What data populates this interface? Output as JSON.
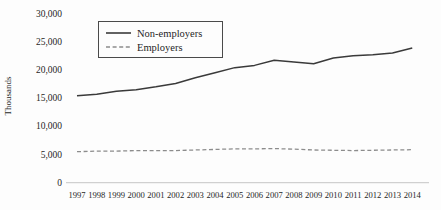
{
  "chart_data": {
    "type": "line",
    "title": "",
    "xlabel": "",
    "ylabel": "Thousands",
    "categories": [
      1997,
      1998,
      1999,
      2000,
      2001,
      2002,
      2003,
      2004,
      2005,
      2006,
      2007,
      2008,
      2009,
      2010,
      2011,
      2012,
      2013,
      2014
    ],
    "series": [
      {
        "name": "Non-employers",
        "line_style": "solid",
        "color": "#3a3a3a",
        "values": [
          15400,
          15700,
          16200,
          16500,
          17000,
          17600,
          18600,
          19500,
          20400,
          20800,
          21700,
          21400,
          21100,
          22100,
          22500,
          22700,
          23000,
          23900
        ]
      },
      {
        "name": "Employers",
        "line_style": "dashed",
        "color": "#8c8c8c",
        "values": [
          5500,
          5600,
          5600,
          5700,
          5700,
          5700,
          5800,
          5900,
          6000,
          6000,
          6050,
          5950,
          5800,
          5750,
          5700,
          5750,
          5800,
          5850
        ]
      }
    ],
    "ylim": [
      0,
      30000
    ],
    "y_ticks": [
      0,
      5000,
      10000,
      15000,
      20000,
      25000,
      30000
    ],
    "y_tick_labels": [
      "0",
      "5,000",
      "10,000",
      "15,000",
      "20,000",
      "25,000",
      "30,000"
    ],
    "grid": false,
    "legend_position": "top-left-inside"
  },
  "colors": {
    "background": "#fdfdfd",
    "axis_line": "#bfbfbf",
    "text": "#1f1f1f",
    "legend_border": "#4a4a4a"
  }
}
